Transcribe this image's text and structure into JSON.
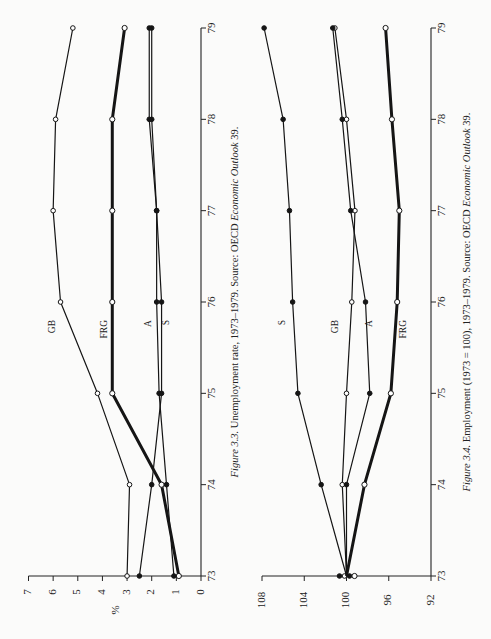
{
  "chart_data": [
    {
      "type": "line",
      "title": "Unemployment rate, 1973–1979",
      "figure_label": "Figure 3.3.",
      "caption_title": "Unemployment rate, 1973–1979.",
      "caption_source_prefix": "Source: OECD",
      "caption_source_italic": "Economic Outlook",
      "caption_source_suffix": "39.",
      "xlabel": "",
      "ylabel": "%",
      "x": [
        "73",
        "74",
        "75",
        "76",
        "77",
        "78",
        "79"
      ],
      "ylim": [
        0,
        7
      ],
      "yticks": [
        "0",
        "1",
        "2",
        "3",
        "4",
        "5",
        "6",
        "7"
      ],
      "series": [
        {
          "name": "GB",
          "marker": "open",
          "weight": "thin",
          "values": [
            3.0,
            2.9,
            4.2,
            5.7,
            6.0,
            5.9,
            5.2
          ]
        },
        {
          "name": "FRG",
          "marker": "open",
          "weight": "thick",
          "values": [
            0.9,
            1.6,
            3.6,
            3.6,
            3.6,
            3.6,
            3.1
          ]
        },
        {
          "name": "A",
          "marker": "filled",
          "weight": "thin",
          "values": [
            1.1,
            1.4,
            1.7,
            1.8,
            1.8,
            2.0,
            2.0
          ]
        },
        {
          "name": "S",
          "marker": "filled",
          "weight": "thin",
          "values": [
            2.5,
            2.0,
            1.6,
            1.6,
            1.8,
            2.1,
            2.1
          ]
        }
      ],
      "series_labels": [
        {
          "name": "GB",
          "at_year": "76"
        },
        {
          "name": "FRG",
          "at_year": "76"
        },
        {
          "name": "A",
          "at_year": "76"
        },
        {
          "name": "S",
          "at_year": "76"
        }
      ],
      "grid": false,
      "orientation": "rotated 90° counterclockwise on page"
    },
    {
      "type": "line",
      "title": "Employment (1973 = 100), 1973–1979",
      "figure_label": "Figure 3.4.",
      "caption_title": "Employment (1973 = 100), 1973–1979.",
      "caption_source_prefix": "Source: OECD",
      "caption_source_italic": "Economic Outlook",
      "caption_source_suffix": "39.",
      "xlabel": "",
      "ylabel": "",
      "x": [
        "73",
        "74",
        "75",
        "76",
        "77",
        "78",
        "79"
      ],
      "ylim": [
        92,
        108
      ],
      "yticks": [
        "92",
        "96",
        "100",
        "104",
        "108"
      ],
      "series": [
        {
          "name": "S",
          "marker": "filled",
          "weight": "thin",
          "values": [
            100,
            102.4,
            104.6,
            105.1,
            105.4,
            106.0,
            107.8
          ]
        },
        {
          "name": "GB",
          "marker": "open",
          "weight": "thin",
          "values": [
            100,
            100.4,
            100.0,
            99.5,
            99.2,
            100.0,
            101.1
          ]
        },
        {
          "name": "A",
          "marker": "filled",
          "weight": "thin",
          "values": [
            100,
            100.0,
            97.8,
            98.2,
            99.6,
            100.4,
            101.3
          ]
        },
        {
          "name": "FRG",
          "marker": "open",
          "weight": "thick",
          "values": [
            100,
            98.3,
            95.8,
            95.2,
            95.0,
            95.7,
            96.3
          ]
        }
      ],
      "grid": false,
      "orientation": "rotated 90° counterclockwise on page"
    }
  ]
}
